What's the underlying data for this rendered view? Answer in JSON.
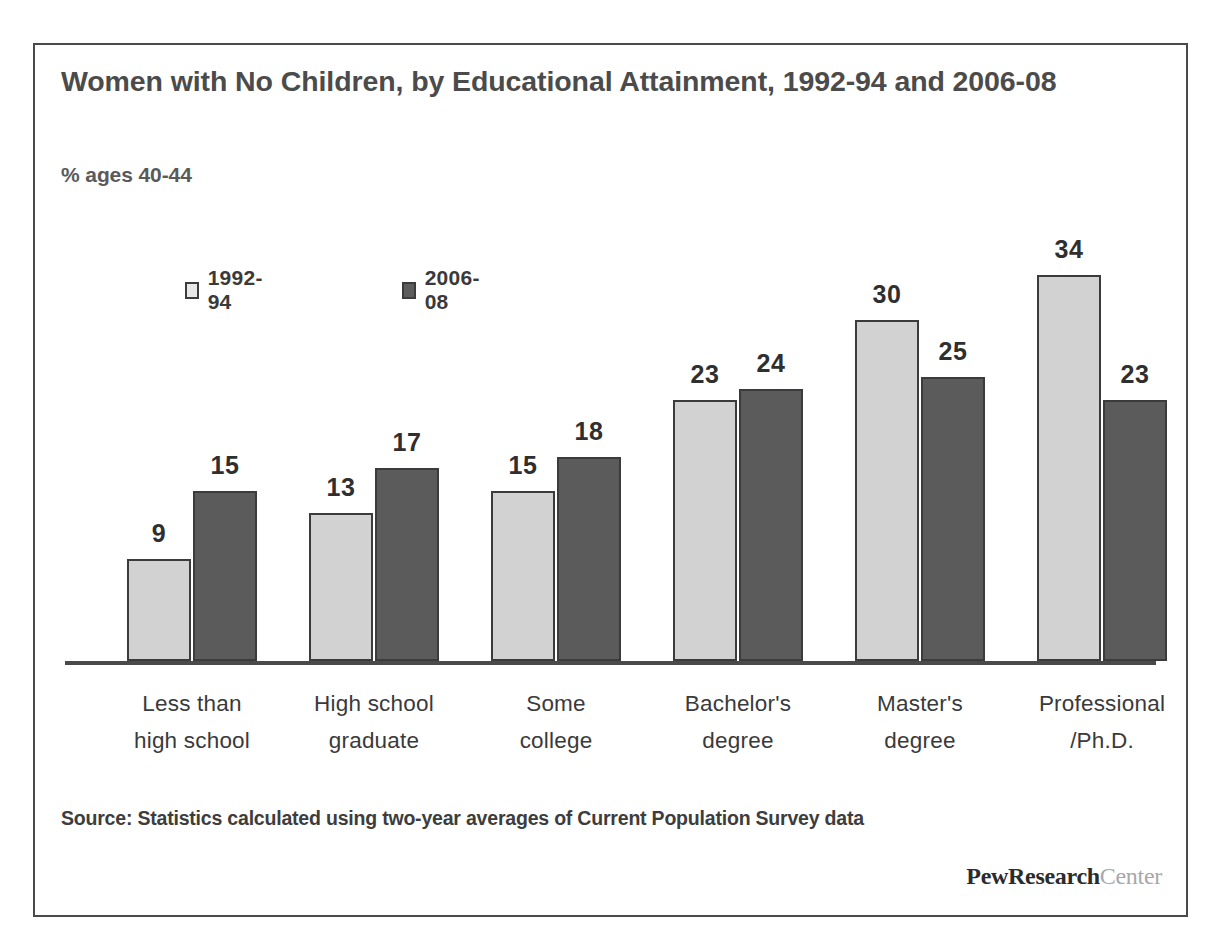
{
  "figure": {
    "title": "Women with No Children, by Educational Attainment, 1992-94 and 2006-08",
    "subtitle": "% ages 40-44",
    "source": "Source: Statistics calculated using two-year averages of Current Population Survey data",
    "logo_primary": "PewResearch",
    "logo_secondary": "Center",
    "colors": {
      "series_1992_94": "#d2d2d2",
      "series_2006_08": "#5b5b5b",
      "bar_outline": "#3b3b3b",
      "axis": "#4a4a4a",
      "title_text": "#4b4b4b",
      "body_text": "#3a3a3a",
      "logo_primary": "#2b2b2b",
      "logo_secondary": "#a8a8a8",
      "frame": "#4a4a4a"
    }
  },
  "chart_data": {
    "type": "bar",
    "title": "Women with No Children, by Educational Attainment, 1992-94 and 2006-08",
    "subtitle": "% ages 40-44",
    "xlabel": "",
    "ylabel": "% ages 40-44",
    "ylim": [
      0,
      34
    ],
    "grid": false,
    "legend_position": "top-left",
    "axis_visible": "x-only",
    "categories": [
      "Less than high school",
      "High school graduate",
      "Some college",
      "Bachelor's degree",
      "Master's degree",
      "Professional /Ph.D."
    ],
    "category_lines": [
      [
        "Less than",
        "high school"
      ],
      [
        "High school",
        "graduate"
      ],
      [
        "Some",
        "college"
      ],
      [
        "Bachelor's",
        "degree"
      ],
      [
        "Master's",
        "degree"
      ],
      [
        "Professional",
        "/Ph.D."
      ]
    ],
    "series": [
      {
        "name": "1992-94",
        "color": "#d2d2d2",
        "values": [
          9,
          13,
          15,
          23,
          30,
          34
        ]
      },
      {
        "name": "2006-08",
        "color": "#5b5b5b",
        "values": [
          15,
          17,
          18,
          24,
          25,
          23
        ]
      }
    ]
  }
}
